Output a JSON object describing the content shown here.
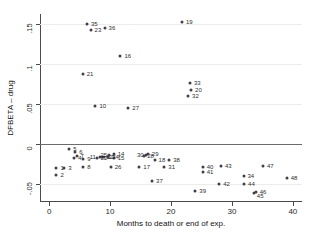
{
  "chart_data": {
    "type": "scatter",
    "title": "",
    "xlabel": "Months to death or end of exp.",
    "ylabel": "DFBETA – drug",
    "xlim": [
      -1.5,
      41.5
    ],
    "ylim": [
      -0.0725,
      0.1625
    ],
    "xticks": [
      0,
      10,
      20,
      30,
      40
    ],
    "xticklabels": [
      "0",
      "10",
      "20",
      "30",
      "40"
    ],
    "yticks": [
      -0.05,
      0,
      0.05,
      0.1,
      0.15
    ],
    "yticklabels": [
      "-.05",
      "0",
      ".05",
      ".1",
      ".15"
    ],
    "grid": true,
    "legend": null,
    "reference_lines": [
      {
        "axis": "y",
        "value": 0
      }
    ],
    "marker": {
      "shape": "circle",
      "color": "#3f3f4c",
      "size": 3
    },
    "point_label_field": "id",
    "points": [
      {
        "id": "1",
        "x": 1.2,
        "y": -0.0295,
        "lx": 4,
        "ly": 0
      },
      {
        "id": "2",
        "x": 1.2,
        "y": -0.0385,
        "lx": 4,
        "ly": 0
      },
      {
        "id": "3",
        "x": 2.5,
        "y": -0.0295,
        "lx": 4,
        "ly": 0
      },
      {
        "id": "4",
        "x": 4.1,
        "y": -0.0175,
        "lx": 4,
        "ly": 0
      },
      {
        "id": "5",
        "x": 3.3,
        "y": -0.0065,
        "lx": 4,
        "ly": 0
      },
      {
        "id": "6",
        "x": 4.3,
        "y": -0.0105,
        "lx": 4,
        "ly": 0
      },
      {
        "id": "7",
        "x": 4.5,
        "y": -0.0145,
        "lx": 4,
        "ly": 0
      },
      {
        "id": "8",
        "x": 5.6,
        "y": -0.029,
        "lx": 4,
        "ly": 0
      },
      {
        "id": "9",
        "x": 5.6,
        "y": -0.019,
        "lx": 4,
        "ly": 0
      },
      {
        "id": "10",
        "x": 7.6,
        "y": 0.048,
        "lx": 4,
        "ly": 0
      },
      {
        "id": "11",
        "x": 8.3,
        "y": -0.0162,
        "lx": -10,
        "ly": 0
      },
      {
        "id": "12",
        "x": 8.7,
        "y": -0.0162,
        "lx": 4,
        "ly": 0
      },
      {
        "id": "13",
        "x": 9.0,
        "y": -0.0162,
        "lx": 4,
        "ly": 0
      },
      {
        "id": "14",
        "x": 10.6,
        "y": -0.012,
        "lx": 4,
        "ly": 0
      },
      {
        "id": "15",
        "x": 10.6,
        "y": -0.018,
        "lx": 4,
        "ly": 0
      },
      {
        "id": "16",
        "x": 11.7,
        "y": 0.11,
        "lx": 4,
        "ly": 0
      },
      {
        "id": "17",
        "x": 14.8,
        "y": -0.029,
        "lx": 4,
        "ly": 0
      },
      {
        "id": "18",
        "x": 17.3,
        "y": -0.02,
        "lx": 4,
        "ly": 0
      },
      {
        "id": "19",
        "x": 21.8,
        "y": 0.1525,
        "lx": 4,
        "ly": 0
      },
      {
        "id": "20",
        "x": 23.3,
        "y": 0.068,
        "lx": 4,
        "ly": 0
      },
      {
        "id": "21",
        "x": 5.5,
        "y": 0.087,
        "lx": 4,
        "ly": 0
      },
      {
        "id": "22",
        "x": 7.8,
        "y": -0.018,
        "lx": 4,
        "ly": 0
      },
      {
        "id": "23",
        "x": 6.8,
        "y": 0.143,
        "lx": 4,
        "ly": 0
      },
      {
        "id": "24",
        "x": 9.7,
        "y": -0.0165,
        "lx": 4,
        "ly": 0
      },
      {
        "id": "25",
        "x": 9.9,
        "y": -0.0135,
        "lx": -9,
        "ly": 0
      },
      {
        "id": "26",
        "x": 10.1,
        "y": -0.0285,
        "lx": 4,
        "ly": 0
      },
      {
        "id": "27",
        "x": 13.0,
        "y": 0.045,
        "lx": 4,
        "ly": 0
      },
      {
        "id": "28",
        "x": 15.6,
        "y": -0.0155,
        "lx": 3,
        "ly": 0
      },
      {
        "id": "29",
        "x": 16.2,
        "y": -0.0125,
        "lx": 4,
        "ly": 0
      },
      {
        "id": "30",
        "x": 15.9,
        "y": -0.014,
        "lx": -9,
        "ly": 0
      },
      {
        "id": "31",
        "x": 18.9,
        "y": -0.0285,
        "lx": 4,
        "ly": 0
      },
      {
        "id": "32",
        "x": 22.8,
        "y": 0.06,
        "lx": 4,
        "ly": 0
      },
      {
        "id": "33",
        "x": 23.1,
        "y": 0.0765,
        "lx": 4,
        "ly": 0
      },
      {
        "id": "34",
        "x": 31.9,
        "y": -0.0405,
        "lx": 4,
        "ly": 0
      },
      {
        "id": "35",
        "x": 6.2,
        "y": 0.1495,
        "lx": 4,
        "ly": 0
      },
      {
        "id": "36",
        "x": 9.1,
        "y": 0.145,
        "lx": 4,
        "ly": 0
      },
      {
        "id": "37",
        "x": 16.9,
        "y": -0.0465,
        "lx": 4,
        "ly": 0
      },
      {
        "id": "38",
        "x": 19.7,
        "y": -0.02,
        "lx": 4,
        "ly": 0
      },
      {
        "id": "39",
        "x": 24.0,
        "y": -0.059,
        "lx": 4,
        "ly": 0
      },
      {
        "id": "40",
        "x": 25.2,
        "y": -0.029,
        "lx": 4,
        "ly": 0
      },
      {
        "id": "41",
        "x": 25.2,
        "y": -0.0355,
        "lx": 4,
        "ly": 0
      },
      {
        "id": "42",
        "x": 27.9,
        "y": -0.0505,
        "lx": 4,
        "ly": 0
      },
      {
        "id": "43",
        "x": 28.2,
        "y": -0.027,
        "lx": 4,
        "ly": 0
      },
      {
        "id": "44",
        "x": 32.0,
        "y": -0.0495,
        "lx": 4,
        "ly": 0
      },
      {
        "id": "45",
        "x": 33.6,
        "y": -0.0615,
        "lx": 3,
        "ly": 3
      },
      {
        "id": "46",
        "x": 33.9,
        "y": -0.0595,
        "lx": 4,
        "ly": 0
      },
      {
        "id": "47",
        "x": 35.1,
        "y": -0.028,
        "lx": 4,
        "ly": 0
      },
      {
        "id": "48",
        "x": 39.0,
        "y": -0.043,
        "lx": 4,
        "ly": 0
      }
    ]
  }
}
